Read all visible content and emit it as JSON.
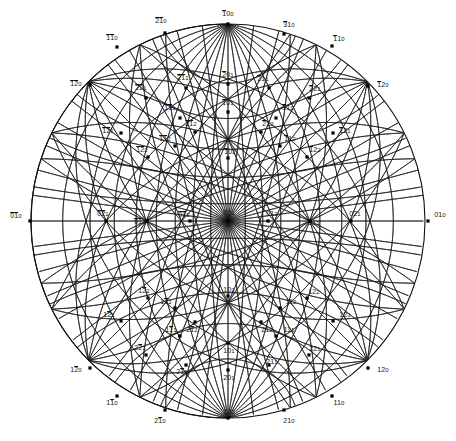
{
  "figure": {
    "kind": "stereographic-projection",
    "title": "",
    "geometry": {
      "cx": 228,
      "cy": 221,
      "radius": 197
    },
    "style": {
      "line_color": "#1a1a1a",
      "point_color": "#000000",
      "background": "#ffffff",
      "label_color": "#111111",
      "line_width": 0.8,
      "point_size": 3.2
    }
  },
  "chart_data": {
    "type": "scatter",
    "title": "",
    "xlabel": "",
    "ylabel": "",
    "projection": "stereographic",
    "note": "Miller indices of poles on a stereographic projection; overbars denote negative indices.",
    "poles": [
      {
        "label": "100",
        "bar": [
          0
        ],
        "x": 228,
        "y": 24
      },
      {
        "label": "210",
        "bar": [
          0,
          1
        ],
        "x": 165,
        "y": 33
      },
      {
        "label": "310",
        "bar": [
          0
        ],
        "x": 284,
        "y": 34
      },
      {
        "label": "110",
        "bar": [
          0,
          1
        ],
        "x": 117,
        "y": 47
      },
      {
        "label": "110",
        "bar": [
          0
        ],
        "x": 332,
        "y": 46
      },
      {
        "label": "120",
        "bar": [
          0,
          1
        ],
        "x": 90,
        "y": 85
      },
      {
        "label": "120",
        "bar": [
          0
        ],
        "x": 368,
        "y": 86
      },
      {
        "label": "201",
        "bar": [
          0
        ],
        "x": 228,
        "y": 84
      },
      {
        "label": "211",
        "bar": [
          0,
          1
        ],
        "x": 186,
        "y": 88
      },
      {
        "label": "211",
        "bar": [
          0
        ],
        "x": 269,
        "y": 88
      },
      {
        "label": "221",
        "bar": [
          0,
          1
        ],
        "x": 146,
        "y": 98
      },
      {
        "label": "221",
        "bar": [
          0
        ],
        "x": 309,
        "y": 98
      },
      {
        "label": "101",
        "bar": [
          0
        ],
        "x": 228,
        "y": 112
      },
      {
        "label": "111",
        "bar": [
          0,
          1
        ],
        "x": 180,
        "y": 118
      },
      {
        "label": "111",
        "bar": [
          0
        ],
        "x": 276,
        "y": 118
      },
      {
        "label": "212",
        "bar": [
          0,
          1
        ],
        "x": 195,
        "y": 132
      },
      {
        "label": "212",
        "bar": [
          0
        ],
        "x": 261,
        "y": 132
      },
      {
        "label": "121",
        "bar": [
          0,
          1
        ],
        "x": 121,
        "y": 133
      },
      {
        "label": "121",
        "bar": [
          0
        ],
        "x": 333,
        "y": 133
      },
      {
        "label": "112",
        "bar": [
          0,
          1
        ],
        "x": 175,
        "y": 146
      },
      {
        "label": "112",
        "bar": [
          0
        ],
        "x": 280,
        "y": 146
      },
      {
        "label": "122",
        "bar": [
          0,
          1
        ],
        "x": 148,
        "y": 157
      },
      {
        "label": "122",
        "bar": [
          0
        ],
        "x": 307,
        "y": 157
      },
      {
        "label": "102",
        "bar": [
          0
        ],
        "x": 228,
        "y": 158
      },
      {
        "label": "010",
        "bar": [
          0,
          1
        ],
        "x": 30,
        "y": 221
      },
      {
        "label": "021",
        "bar": [
          0,
          1
        ],
        "x": 106,
        "y": 221
      },
      {
        "label": "011",
        "bar": [
          0,
          1
        ],
        "x": 147,
        "y": 221
      },
      {
        "label": "012",
        "bar": [
          0,
          1
        ],
        "x": 190,
        "y": 221
      },
      {
        "label": "001",
        "bar": [],
        "x": 228,
        "y": 221
      },
      {
        "label": "012",
        "bar": [],
        "x": 268,
        "y": 221
      },
      {
        "label": "011",
        "bar": [],
        "x": 310,
        "y": 221
      },
      {
        "label": "021",
        "bar": [],
        "x": 351,
        "y": 221
      },
      {
        "label": "010",
        "bar": [],
        "x": 428,
        "y": 221
      },
      {
        "label": "102",
        "bar": [],
        "x": 228,
        "y": 296
      },
      {
        "label": "122",
        "bar": [
          1
        ],
        "x": 148,
        "y": 298
      },
      {
        "label": "122",
        "bar": [],
        "x": 307,
        "y": 298
      },
      {
        "label": "112",
        "bar": [
          1
        ],
        "x": 175,
        "y": 308
      },
      {
        "label": "112",
        "bar": [],
        "x": 280,
        "y": 308
      },
      {
        "label": "121",
        "bar": [
          1
        ],
        "x": 121,
        "y": 321
      },
      {
        "label": "121",
        "bar": [],
        "x": 333,
        "y": 321
      },
      {
        "label": "212",
        "bar": [
          1
        ],
        "x": 195,
        "y": 322
      },
      {
        "label": "212",
        "bar": [],
        "x": 261,
        "y": 322
      },
      {
        "label": "111",
        "bar": [
          1
        ],
        "x": 180,
        "y": 336
      },
      {
        "label": "111",
        "bar": [],
        "x": 276,
        "y": 336
      },
      {
        "label": "101",
        "bar": [],
        "x": 228,
        "y": 343
      },
      {
        "label": "221",
        "bar": [
          1
        ],
        "x": 146,
        "y": 355
      },
      {
        "label": "221",
        "bar": [],
        "x": 309,
        "y": 355
      },
      {
        "label": "211",
        "bar": [
          1
        ],
        "x": 186,
        "y": 365
      },
      {
        "label": "211",
        "bar": [],
        "x": 269,
        "y": 365
      },
      {
        "label": "201",
        "bar": [],
        "x": 228,
        "y": 370
      },
      {
        "label": "120",
        "bar": [
          1
        ],
        "x": 90,
        "y": 368
      },
      {
        "label": "120",
        "bar": [],
        "x": 368,
        "y": 368
      },
      {
        "label": "110",
        "bar": [
          1
        ],
        "x": 117,
        "y": 396
      },
      {
        "label": "110",
        "bar": [],
        "x": 332,
        "y": 396
      },
      {
        "label": "210",
        "bar": [
          1
        ],
        "x": 165,
        "y": 410
      },
      {
        "label": "210",
        "bar": [],
        "x": 284,
        "y": 410
      },
      {
        "label": "100",
        "bar": [],
        "x": 228,
        "y": 418
      }
    ]
  },
  "labels": [
    {
      "text": "100",
      "bar": [
        0
      ],
      "x": 228,
      "y": 14,
      "anchor": "center"
    },
    {
      "text": "210",
      "bar": [
        0,
        1
      ],
      "x": 161,
      "y": 21,
      "anchor": "center"
    },
    {
      "text": "310",
      "bar": [
        0
      ],
      "x": 289,
      "y": 25,
      "anchor": "center"
    },
    {
      "text": "110",
      "bar": [
        0,
        1
      ],
      "x": 112,
      "y": 38,
      "anchor": "center"
    },
    {
      "text": "110",
      "bar": [
        0
      ],
      "x": 339,
      "y": 39,
      "anchor": "center"
    },
    {
      "text": "120",
      "bar": [
        0,
        1
      ],
      "x": 76,
      "y": 84,
      "anchor": "center"
    },
    {
      "text": "120",
      "bar": [
        0
      ],
      "x": 383,
      "y": 85,
      "anchor": "center"
    },
    {
      "text": "201",
      "bar": [
        0
      ],
      "x": 228,
      "y": 75,
      "anchor": "center"
    },
    {
      "text": "211",
      "bar": [
        0,
        1
      ],
      "x": 183,
      "y": 78,
      "anchor": "center"
    },
    {
      "text": "211",
      "bar": [
        0
      ],
      "x": 263,
      "y": 79,
      "anchor": "center"
    },
    {
      "text": "221",
      "bar": [
        0,
        1
      ],
      "x": 141,
      "y": 88,
      "anchor": "center"
    },
    {
      "text": "221",
      "bar": [
        0
      ],
      "x": 315,
      "y": 89,
      "anchor": "center"
    },
    {
      "text": "101",
      "bar": [
        0
      ],
      "x": 228,
      "y": 103,
      "anchor": "center"
    },
    {
      "text": "111",
      "bar": [
        0,
        1
      ],
      "x": 170,
      "y": 108,
      "anchor": "center"
    },
    {
      "text": "111",
      "bar": [
        0
      ],
      "x": 288,
      "y": 108,
      "anchor": "center"
    },
    {
      "text": "212",
      "bar": [
        0,
        1
      ],
      "x": 191,
      "y": 124,
      "anchor": "center"
    },
    {
      "text": "212",
      "bar": [
        0
      ],
      "x": 268,
      "y": 124,
      "anchor": "center"
    },
    {
      "text": "121",
      "bar": [
        0,
        1
      ],
      "x": 108,
      "y": 131,
      "anchor": "center"
    },
    {
      "text": "121",
      "bar": [
        0
      ],
      "x": 345,
      "y": 131,
      "anchor": "center"
    },
    {
      "text": "112",
      "bar": [
        0,
        1
      ],
      "x": 165,
      "y": 139,
      "anchor": "center"
    },
    {
      "text": "112",
      "bar": [
        0
      ],
      "x": 290,
      "y": 139,
      "anchor": "center"
    },
    {
      "text": "122",
      "bar": [
        0,
        1
      ],
      "x": 142,
      "y": 150,
      "anchor": "center"
    },
    {
      "text": "122",
      "bar": [
        0
      ],
      "x": 315,
      "y": 150,
      "anchor": "center"
    },
    {
      "text": "102",
      "bar": [
        0
      ],
      "x": 230,
      "y": 152,
      "anchor": "center"
    },
    {
      "text": "010",
      "bar": [
        0,
        1
      ],
      "x": 16,
      "y": 216,
      "anchor": "center"
    },
    {
      "text": "021",
      "bar": [
        0,
        1
      ],
      "x": 103,
      "y": 214,
      "anchor": "center"
    },
    {
      "text": "011",
      "bar": [
        0,
        1
      ],
      "x": 140,
      "y": 222,
      "anchor": "center"
    },
    {
      "text": "012",
      "bar": [
        0,
        1
      ],
      "x": 184,
      "y": 215,
      "anchor": "center"
    },
    {
      "text": "001",
      "bar": [],
      "x": 229,
      "y": 213,
      "anchor": "center"
    },
    {
      "text": "012",
      "bar": [],
      "x": 272,
      "y": 214,
      "anchor": "center"
    },
    {
      "text": "011",
      "bar": [],
      "x": 314,
      "y": 223,
      "anchor": "center"
    },
    {
      "text": "021",
      "bar": [],
      "x": 355,
      "y": 214,
      "anchor": "center"
    },
    {
      "text": "010",
      "bar": [],
      "x": 440,
      "y": 215,
      "anchor": "center"
    },
    {
      "text": "102",
      "bar": [],
      "x": 229,
      "y": 290,
      "anchor": "center"
    },
    {
      "text": "122",
      "bar": [
        1
      ],
      "x": 144,
      "y": 291,
      "anchor": "center"
    },
    {
      "text": "122",
      "bar": [],
      "x": 314,
      "y": 292,
      "anchor": "center"
    },
    {
      "text": "112",
      "bar": [
        1
      ],
      "x": 166,
      "y": 302,
      "anchor": "center"
    },
    {
      "text": "112",
      "bar": [],
      "x": 291,
      "y": 302,
      "anchor": "center"
    },
    {
      "text": "121",
      "bar": [
        1
      ],
      "x": 109,
      "y": 315,
      "anchor": "center"
    },
    {
      "text": "121",
      "bar": [],
      "x": 345,
      "y": 315,
      "anchor": "center"
    },
    {
      "text": "212",
      "bar": [
        1
      ],
      "x": 192,
      "y": 330,
      "anchor": "center"
    },
    {
      "text": "212",
      "bar": [],
      "x": 267,
      "y": 330,
      "anchor": "center"
    },
    {
      "text": "111",
      "bar": [
        1
      ],
      "x": 171,
      "y": 330,
      "anchor": "center"
    },
    {
      "text": "111",
      "bar": [],
      "x": 289,
      "y": 330,
      "anchor": "center"
    },
    {
      "text": "101",
      "bar": [],
      "x": 229,
      "y": 351,
      "anchor": "center"
    },
    {
      "text": "221",
      "bar": [
        1
      ],
      "x": 140,
      "y": 348,
      "anchor": "center"
    },
    {
      "text": "221",
      "bar": [],
      "x": 315,
      "y": 349,
      "anchor": "center"
    },
    {
      "text": "211",
      "bar": [
        1
      ],
      "x": 182,
      "y": 372,
      "anchor": "center"
    },
    {
      "text": "211",
      "bar": [],
      "x": 272,
      "y": 362,
      "anchor": "center"
    },
    {
      "text": "201",
      "bar": [],
      "x": 229,
      "y": 378,
      "anchor": "center"
    },
    {
      "text": "120",
      "bar": [
        1
      ],
      "x": 76,
      "y": 370,
      "anchor": "center"
    },
    {
      "text": "120",
      "bar": [],
      "x": 383,
      "y": 370,
      "anchor": "center"
    },
    {
      "text": "110",
      "bar": [
        1
      ],
      "x": 112,
      "y": 403,
      "anchor": "center"
    },
    {
      "text": "110",
      "bar": [],
      "x": 339,
      "y": 403,
      "anchor": "center"
    },
    {
      "text": "210",
      "bar": [
        1
      ],
      "x": 160,
      "y": 421,
      "anchor": "center"
    },
    {
      "text": "210",
      "bar": [],
      "x": 289,
      "y": 421,
      "anchor": "center"
    },
    {
      "text": "100",
      "bar": [],
      "x": 229,
      "y": 412,
      "anchor": "center"
    }
  ],
  "net": {
    "meridian_angles_deg": [
      10,
      20,
      30,
      40,
      50,
      60,
      70,
      80,
      90,
      100,
      110,
      120,
      130,
      140,
      150,
      160,
      170
    ],
    "small_circle_angles_deg": [
      20,
      35,
      50,
      65,
      80,
      100,
      115,
      130,
      145,
      160
    ],
    "zone_great_circles": 24
  }
}
